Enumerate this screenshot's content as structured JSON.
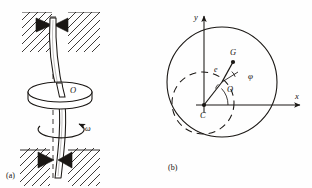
{
  "figure": {
    "background_color": "#fefefe",
    "ink_color": "#1a1714",
    "panels": [
      {
        "id": "a",
        "caption": "(a)",
        "description": "Bowed vertical rotating shaft mounted in two hatched bearings with a disk at mid-span",
        "labels": [
          {
            "name": "disk-center-label",
            "text": "O",
            "italic": true
          },
          {
            "name": "angular-velocity-label",
            "text": "ω",
            "italic": true
          }
        ]
      },
      {
        "id": "b",
        "caption": "(b)",
        "description": "Cross-section: large shaft circle, dashed whirl orbit, geometric center O, mass center G, eccentricity e and phase angle phi measured from the C-O line",
        "axes": {
          "x_label": "x",
          "y_label": "y",
          "origin_label": "C"
        },
        "labels": [
          {
            "name": "mass-center-label",
            "text": "G",
            "italic": true
          },
          {
            "name": "eccentricity-label",
            "text": "e",
            "italic": true
          },
          {
            "name": "phase-angle-label",
            "text": "φ",
            "italic": true
          },
          {
            "name": "geometric-center-label",
            "text": "O",
            "italic": true
          },
          {
            "name": "bearing-center-label",
            "text": "C",
            "italic": true
          }
        ]
      }
    ]
  }
}
